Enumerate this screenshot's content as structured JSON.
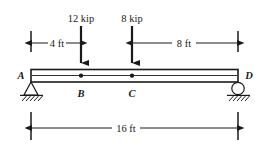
{
  "diagram": {
    "type": "free-body-diagram",
    "units": {
      "force": "kip",
      "length": "ft"
    },
    "span_label": "16 ft",
    "loads": [
      {
        "id": "load-b",
        "label": "12 kip",
        "magnitude": 12,
        "unit": "kip",
        "at_point": "B",
        "position_ft": 4,
        "direction": "down"
      },
      {
        "id": "load-c",
        "label": "8 kip",
        "magnitude": 8,
        "unit": "kip",
        "at_point": "C",
        "position_ft": 8,
        "direction": "down"
      }
    ],
    "points": [
      {
        "id": "point-a",
        "label": "A",
        "position_ft": 0,
        "kind": "pin-support"
      },
      {
        "id": "point-b",
        "label": "B",
        "position_ft": 4,
        "kind": "load-point"
      },
      {
        "id": "point-c",
        "label": "C",
        "position_ft": 8,
        "kind": "load-point"
      },
      {
        "id": "point-d",
        "label": "D",
        "position_ft": 16,
        "kind": "roller-support"
      }
    ],
    "dimensions": [
      {
        "id": "dim-a-b",
        "label": "4 ft",
        "value": 4,
        "unit": "ft",
        "from": "A",
        "to": "B"
      },
      {
        "id": "dim-c-d",
        "label": "8 ft",
        "value": 8,
        "unit": "ft",
        "from": "C",
        "to": "D"
      },
      {
        "id": "dim-span",
        "label": "16 ft",
        "value": 16,
        "unit": "ft",
        "from": "A",
        "to": "D"
      }
    ],
    "supports": [
      {
        "id": "support-a",
        "label": "A",
        "type": "pin",
        "icon": "triangle-pin-support-icon"
      },
      {
        "id": "support-d",
        "label": "D",
        "type": "roller",
        "icon": "circle-roller-support-icon"
      }
    ],
    "colors": {
      "ink": "#1a1a1a",
      "paper": "#ffffff"
    }
  }
}
